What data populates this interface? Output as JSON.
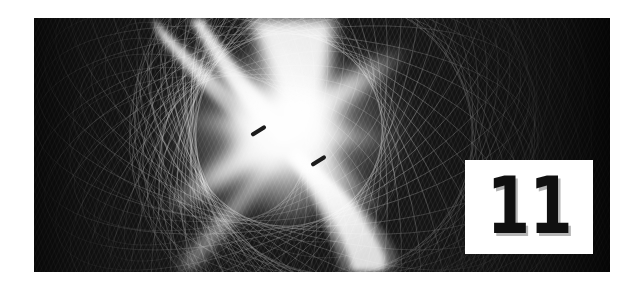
{
  "page": {
    "background_color": "#ffffff",
    "width": 644,
    "height": 291,
    "kind": "chapter-opener"
  },
  "artwork": {
    "name": "spirograph-guilloche-burst",
    "description": "Dark monochrome moire / spirograph line pattern with a bright radiant X-shaped light burst near the center",
    "panel": {
      "x": 34,
      "y": 18,
      "width": 576,
      "height": 254
    },
    "colors": {
      "background_dark": "#141414",
      "background_darkest": "#0d0d0d",
      "line_light": "#d8d8d8",
      "line_mid": "#8a8a8a",
      "burst_core": "#ffffff",
      "dash_mark": "#1a1a1a"
    },
    "burst": {
      "center_x": 252,
      "center_y": 112,
      "radius": 120
    },
    "dash_marks": [
      {
        "x": 224,
        "y": 114,
        "angle": -34
      },
      {
        "x": 284,
        "y": 144,
        "angle": -34
      }
    ]
  },
  "chapter": {
    "number": "11",
    "box": {
      "x": 465,
      "y": 160,
      "width": 128,
      "height": 94,
      "fill": "#ffffff",
      "text_color": "#101010"
    }
  }
}
